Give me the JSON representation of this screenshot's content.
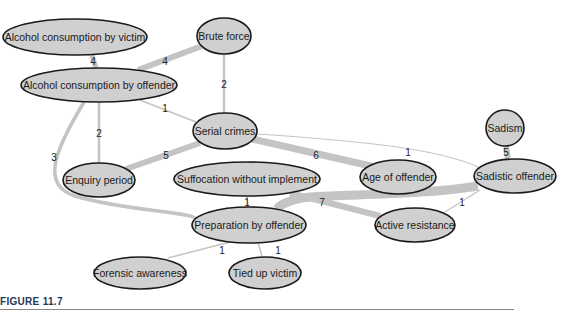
{
  "figure": {
    "caption": "FIGURE 11.7"
  },
  "nodes": {
    "alcohol_victim": {
      "label": "Alcohol consumption by victim",
      "cx": 75,
      "cy": 37,
      "rx": 72,
      "ry": 18
    },
    "brute_force": {
      "label": "Brute force",
      "cx": 224,
      "cy": 36,
      "rx": 27,
      "ry": 18
    },
    "alcohol_offender": {
      "label": "Alcohol consumption by offender",
      "cx": 99,
      "cy": 85,
      "rx": 77,
      "ry": 17
    },
    "serial_crimes": {
      "label": "Serial crimes",
      "cx": 225,
      "cy": 131,
      "rx": 31,
      "ry": 18
    },
    "enquiry_period": {
      "label": "Enquiry period",
      "cx": 99,
      "cy": 180,
      "rx": 35,
      "ry": 17
    },
    "suffocation": {
      "label": "Suffocation without implement",
      "cx": 247,
      "cy": 179,
      "rx": 73,
      "ry": 17
    },
    "age_offender": {
      "label": "Age of offender",
      "cx": 398,
      "cy": 177,
      "rx": 37,
      "ry": 17
    },
    "sadism": {
      "label": "Sadism",
      "cx": 505,
      "cy": 128,
      "rx": 19,
      "ry": 18
    },
    "sadistic_offender": {
      "label": "Sadistic offender",
      "cx": 515,
      "cy": 176,
      "rx": 40,
      "ry": 17
    },
    "active_resistance": {
      "label": "Active resistance",
      "cx": 415,
      "cy": 225,
      "rx": 39,
      "ry": 17
    },
    "preparation": {
      "label": "Preparation by offender",
      "cx": 249,
      "cy": 225,
      "rx": 56,
      "ry": 18
    },
    "forensic": {
      "label": "Forensic awareness",
      "cx": 140,
      "cy": 273,
      "rx": 46,
      "ry": 17
    },
    "tied_up": {
      "label": "Tied up victim",
      "cx": 265,
      "cy": 273,
      "rx": 36,
      "ry": 17
    }
  },
  "edges": [
    {
      "from": "alcohol_victim",
      "to": "alcohol_offender",
      "weight": "4"
    },
    {
      "from": "brute_force",
      "to": "alcohol_offender",
      "weight": "4"
    },
    {
      "from": "brute_force",
      "to": "serial_crimes",
      "weight": "2"
    },
    {
      "from": "alcohol_offender",
      "to": "serial_crimes",
      "weight": "1"
    },
    {
      "from": "alcohol_offender",
      "to": "enquiry_period",
      "weight": "2"
    },
    {
      "from": "alcohol_offender",
      "to": "preparation",
      "weight": "3"
    },
    {
      "from": "serial_crimes",
      "to": "enquiry_period",
      "weight": "5"
    },
    {
      "from": "serial_crimes",
      "to": "age_offender",
      "weight": "6"
    },
    {
      "from": "serial_crimes",
      "to": "sadistic_offender",
      "weight": "1"
    },
    {
      "from": "sadism",
      "to": "sadistic_offender",
      "weight": "5"
    },
    {
      "from": "sadistic_offender",
      "to": "preparation",
      "weight": "7"
    },
    {
      "from": "suffocation",
      "to": "active_resistance",
      "weight": ""
    },
    {
      "from": "sadistic_offender",
      "to": "active_resistance",
      "weight": "1"
    },
    {
      "from": "suffocation",
      "to": "preparation",
      "weight": "1"
    },
    {
      "from": "preparation",
      "to": "forensic",
      "weight": "1"
    },
    {
      "from": "preparation",
      "to": "tied_up",
      "weight": "1"
    }
  ],
  "edge_labels": {
    "e_av_ao": "4",
    "e_bf_ao": "4",
    "e_bf_sc": "2",
    "e_ao_sc": "1",
    "e_ao_ep": "2",
    "e_ao_pr": "3",
    "e_sc_ep": "5",
    "e_sc_age": "6",
    "e_sc_so": "1",
    "e_sad_so": "5",
    "e_so_pr": "7",
    "e_so_ar": "1",
    "e_suf_pr": "1",
    "e_pr_fa": "1",
    "e_pr_tv": "1"
  }
}
